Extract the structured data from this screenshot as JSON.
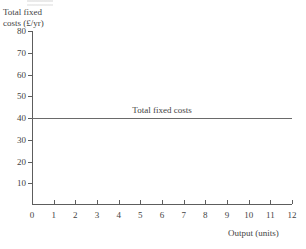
{
  "chart_data": {
    "type": "line",
    "title": "",
    "subtitle": "",
    "xlabel": "Output (units)",
    "ylabel_lines": [
      "Total fixed",
      "costs (£/yr)"
    ],
    "ylabel": "Total fixed costs (£/yr)",
    "xlim": [
      0,
      12
    ],
    "ylim": [
      0,
      80
    ],
    "xticks": [
      0,
      1,
      2,
      3,
      4,
      5,
      6,
      7,
      8,
      9,
      10,
      11,
      12
    ],
    "xtick_labels": [
      "0",
      "1",
      "2",
      "3",
      "4",
      "5",
      "6",
      "7",
      "8",
      "9",
      "10",
      "11",
      "12"
    ],
    "yticks": [
      10,
      20,
      30,
      40,
      50,
      60,
      70,
      80
    ],
    "ytick_labels": [
      "10",
      "20",
      "30",
      "40",
      "50",
      "60",
      "70",
      "80"
    ],
    "grid": false,
    "legend": "none",
    "series": [
      {
        "name": "Total fixed costs",
        "x": [
          0,
          12
        ],
        "values": [
          40,
          40
        ],
        "constant_value": 40,
        "color": "#6a6a6a",
        "annotation": {
          "text": "Total fixed costs",
          "x": 6,
          "y": 40
        }
      }
    ],
    "axis_color": "#5d5d5d",
    "text_color": "#434343"
  }
}
